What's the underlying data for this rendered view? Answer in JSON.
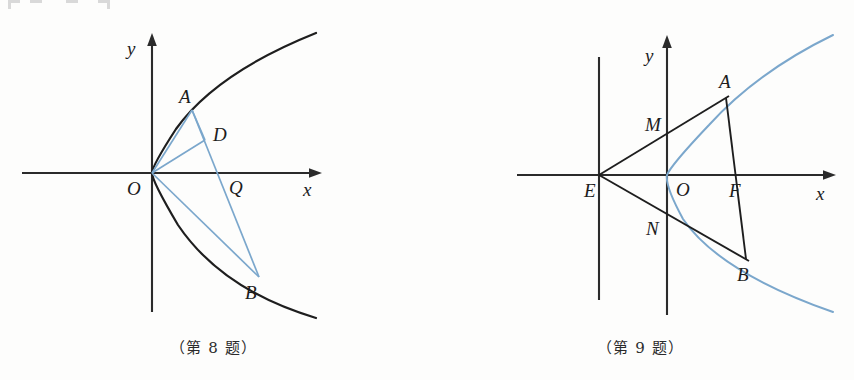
{
  "page": {
    "background_color": "#fdfdfc",
    "width": 854,
    "height": 380
  },
  "colors": {
    "axis_black": "#2b2b2b",
    "curve_black": "#1e1e1e",
    "accent_blue": "#7ba7cc",
    "label_text": "#1c1c1c"
  },
  "figures": [
    {
      "id": "figure-8",
      "caption": "（第 8 题）",
      "axes": {
        "x_label": "x",
        "y_label": "y",
        "origin_label": "O"
      },
      "curve": {
        "kind": "parabola",
        "opens": "right",
        "color": "black",
        "description": "y^2 = 2px opening rightward, vertex at origin"
      },
      "points": [
        {
          "label": "A",
          "x": 192,
          "y": 110,
          "on": "parabola-upper"
        },
        {
          "label": "D",
          "x": 205,
          "y": 140,
          "on": "segment-interior"
        },
        {
          "label": "Q",
          "x": 219,
          "y": 173,
          "on": "x-axis"
        },
        {
          "label": "B",
          "x": 259,
          "y": 277,
          "on": "parabola-lower"
        },
        {
          "label": "O",
          "x": 152,
          "y": 173,
          "on": "origin"
        }
      ],
      "segments": [
        {
          "from": "O",
          "to": "A",
          "color": "blue"
        },
        {
          "from": "O",
          "to": "D",
          "color": "blue"
        },
        {
          "from": "O",
          "to": "B",
          "color": "blue"
        },
        {
          "from": "A",
          "to": "B",
          "color": "blue"
        },
        {
          "from": "A",
          "to": "D",
          "color": "blue"
        }
      ]
    },
    {
      "id": "figure-9",
      "caption": "（第 9 题）",
      "axes": {
        "x_label": "x",
        "y_label": "y",
        "origin_label": "O"
      },
      "curve": {
        "kind": "parabola",
        "opens": "right",
        "color": "blue",
        "description": "y^2 = 2px opening rightward, vertex at origin"
      },
      "points": [
        {
          "label": "E",
          "x": 599,
          "y": 175,
          "on": "directrix-x-axis-intersection"
        },
        {
          "label": "M",
          "x": 667,
          "y": 139,
          "on": "y-axis"
        },
        {
          "label": "N",
          "x": 667,
          "y": 211,
          "on": "y-axis"
        },
        {
          "label": "O",
          "x": 667,
          "y": 175,
          "on": "origin"
        },
        {
          "label": "F",
          "x": 737,
          "y": 175,
          "on": "x-axis-focus"
        },
        {
          "label": "A",
          "x": 726,
          "y": 98,
          "on": "parabola-upper"
        },
        {
          "label": "B",
          "x": 746,
          "y": 259,
          "on": "parabola-lower"
        }
      ],
      "segments": [
        {
          "from": "E",
          "to": "A",
          "color": "black",
          "note": "passes through M"
        },
        {
          "from": "E",
          "to": "B",
          "color": "black",
          "note": "passes through N"
        },
        {
          "from": "A",
          "to": "B",
          "color": "black",
          "note": "focal chord through F"
        }
      ],
      "directrix": {
        "kind": "vertical-line",
        "x": 599,
        "y_top": 57,
        "y_bottom": 300,
        "color": "black"
      }
    }
  ]
}
